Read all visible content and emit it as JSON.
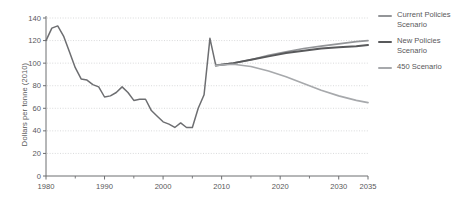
{
  "chart_data": {
    "type": "line",
    "title": "",
    "xlabel": "",
    "ylabel": "Dollars per tonne (2010)",
    "xlim": [
      1980,
      2035
    ],
    "ylim": [
      0,
      140
    ],
    "yticks": [
      0,
      20,
      40,
      60,
      80,
      100,
      120,
      140
    ],
    "xticks": [
      1980,
      1990,
      2000,
      2010,
      2020,
      2030,
      2035
    ],
    "xminorticks": [
      1985,
      1995,
      2005,
      2015,
      2025
    ],
    "grid": "horizontal-dotted",
    "legend_position": "right",
    "series": [
      {
        "name": "Historical",
        "color": "#6d6e71",
        "width": 1.5,
        "in_legend": false,
        "x": [
          1980,
          1981,
          1982,
          1983,
          1984,
          1985,
          1986,
          1987,
          1988,
          1989,
          1990,
          1991,
          1992,
          1993,
          1994,
          1995,
          1996,
          1997,
          1998,
          1999,
          2000,
          2001,
          2002,
          2003,
          2004,
          2005,
          2006,
          2007,
          2008,
          2009
        ],
        "y": [
          120,
          131,
          133,
          124,
          110,
          96,
          86,
          85,
          81,
          79,
          70,
          71,
          74,
          79,
          74,
          67,
          68,
          68,
          58,
          53,
          48,
          46,
          43,
          47,
          43,
          43,
          60,
          72,
          122,
          98
        ]
      },
      {
        "name": "Current Policies Scenario",
        "color": "#939598",
        "width": 1.7,
        "in_legend": true,
        "x": [
          2009,
          2012,
          2015,
          2018,
          2021,
          2024,
          2027,
          2030,
          2033,
          2035
        ],
        "y": [
          98,
          100,
          103,
          107,
          110,
          113,
          115,
          117,
          119,
          120
        ]
      },
      {
        "name": "New Policies Scenario",
        "color": "#58595b",
        "width": 2.0,
        "in_legend": true,
        "x": [
          2009,
          2012,
          2015,
          2018,
          2021,
          2024,
          2027,
          2030,
          2033,
          2035
        ],
        "y": [
          98,
          100,
          103,
          106,
          109,
          111,
          113,
          114,
          115,
          116
        ]
      },
      {
        "name": "450 Scenario",
        "color": "#a7a9ac",
        "width": 1.7,
        "in_legend": true,
        "x": [
          2009,
          2012,
          2015,
          2018,
          2021,
          2024,
          2027,
          2030,
          2033,
          2035
        ],
        "y": [
          98,
          99,
          97,
          93,
          88,
          82,
          76,
          71,
          67,
          65
        ]
      }
    ]
  },
  "axis": {
    "ylabel": "Dollars per tonne (2010)",
    "ytick_labels": [
      "140",
      "120",
      "100",
      "80",
      "60",
      "40",
      "20",
      "0"
    ],
    "xtick_labels": [
      "1980",
      "1990",
      "2000",
      "2010",
      "2020",
      "2030",
      "2035"
    ]
  },
  "legend": {
    "items": [
      {
        "label": "Current Policies Scenario",
        "color": "#939598"
      },
      {
        "label": "New Policies Scenario",
        "color": "#58595b"
      },
      {
        "label": "450 Scenario",
        "color": "#a7a9ac"
      }
    ]
  },
  "colors": {
    "axis": "#6d6e71",
    "grid": "#cfd0d2",
    "text": "#58585a"
  }
}
